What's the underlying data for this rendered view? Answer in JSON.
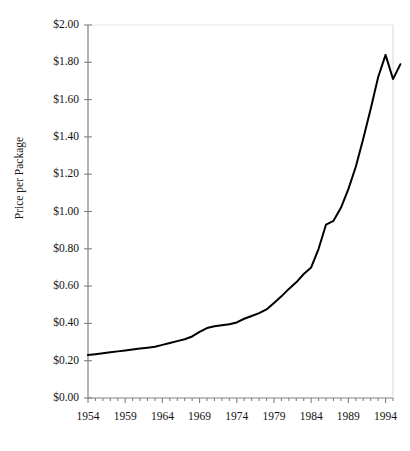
{
  "figure": {
    "truncated_header_text": "",
    "background_color": "#ffffff",
    "line_color": "#000000",
    "axis_color": "#808080"
  },
  "chart_data": {
    "type": "line",
    "title": "",
    "xlabel": "",
    "ylabel": "Price per Package",
    "ylim": [
      0,
      2
    ],
    "xlim": [
      1954,
      1995
    ],
    "ytick_labels": [
      "$2.00",
      "$1.80",
      "$1.60",
      "$1.40",
      "$1.20",
      "$1.00",
      "$0.80",
      "$0.60",
      "$0.40",
      "$0.20",
      "$0.00"
    ],
    "ytick_values": [
      2.0,
      1.8,
      1.6,
      1.4,
      1.2,
      1.0,
      0.8,
      0.6,
      0.4,
      0.2,
      0.0
    ],
    "xtick_labels": [
      "1954",
      "1959",
      "1964",
      "1969",
      "1974",
      "1979",
      "1984",
      "1989",
      "1994"
    ],
    "xtick_values": [
      1954,
      1959,
      1964,
      1969,
      1974,
      1979,
      1984,
      1989,
      1994
    ],
    "minor_xticks_every": 1,
    "grid": false,
    "legend": null,
    "series": [
      {
        "name": "Price per Package",
        "x": [
          1954,
          1955,
          1956,
          1957,
          1958,
          1959,
          1960,
          1961,
          1962,
          1963,
          1964,
          1965,
          1966,
          1967,
          1968,
          1969,
          1970,
          1971,
          1972,
          1973,
          1974,
          1975,
          1976,
          1977,
          1978,
          1979,
          1980,
          1981,
          1982,
          1983,
          1984,
          1985,
          1986,
          1987,
          1988,
          1989,
          1990,
          1991,
          1992,
          1993,
          1994,
          1995
        ],
        "values": [
          0.23,
          0.235,
          0.24,
          0.245,
          0.25,
          0.255,
          0.26,
          0.265,
          0.27,
          0.275,
          0.285,
          0.295,
          0.305,
          0.315,
          0.33,
          0.355,
          0.375,
          0.385,
          0.39,
          0.395,
          0.405,
          0.425,
          0.44,
          0.455,
          0.475,
          0.51,
          0.545,
          0.585,
          0.62,
          0.665,
          0.7,
          0.8,
          0.93,
          0.95,
          1.02,
          1.12,
          1.24,
          1.39,
          1.55,
          1.72,
          1.84,
          1.71
        ]
      }
    ],
    "final_point": {
      "x": 1996,
      "value": 1.79
    }
  },
  "axis_geometry": {
    "plot_left_px": 88,
    "plot_right_px": 393,
    "plot_top_px": 25,
    "plot_bottom_px": 398
  }
}
